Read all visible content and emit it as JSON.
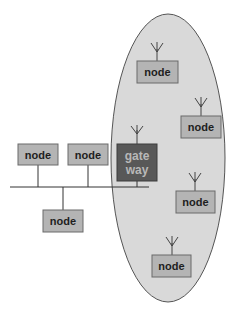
{
  "diagram": {
    "wireless_area": {
      "label": ""
    },
    "gateway": {
      "line1": "gate",
      "line2": "way"
    },
    "wired_nodes": [
      {
        "label": "node"
      },
      {
        "label": "node"
      },
      {
        "label": "node"
      }
    ],
    "wireless_nodes": [
      {
        "label": "node"
      },
      {
        "label": "node"
      },
      {
        "label": "node"
      },
      {
        "label": "node"
      }
    ],
    "colors": {
      "node_fill": "#b4b4b4",
      "gateway_fill": "#585858",
      "wireless_area_fill": "#d9d9d9"
    }
  }
}
